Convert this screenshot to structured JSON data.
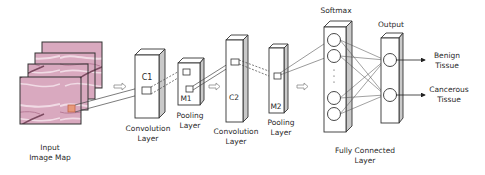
{
  "labels": {
    "input": [
      "Input",
      "Image Map"
    ],
    "conv1": [
      "Convolution",
      "Layer"
    ],
    "pool1": [
      "Pooling",
      "Layer"
    ],
    "conv2": [
      "Convolution",
      "Layer"
    ],
    "pool2": [
      "Pooling",
      "Layer"
    ],
    "softmax": "Softmax",
    "output": "Output",
    "fc": [
      "Fully Connected",
      "Layer"
    ],
    "class_benign": [
      "Benign",
      "Tissue"
    ],
    "class_cancerous": [
      "Cancerous",
      "Tissue"
    ]
  },
  "blocks": {
    "c1": "C1",
    "m1": "M1",
    "c2": "C2",
    "m2": "M2"
  },
  "colors": {
    "stroke": "#333333",
    "side_face": "#c9c9c9",
    "tissue_base": "#d9a9bf",
    "tissue_dark": "#b77b97",
    "tissue_light": "#f1dbe5",
    "patch": "#e6997a",
    "arrow": "#8a8a8a"
  }
}
